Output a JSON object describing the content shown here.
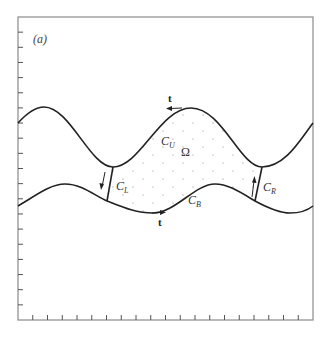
{
  "figure": {
    "panel_label": "(a)",
    "region_label": "Ω",
    "tangent_label": "t",
    "boundaries": {
      "upper": {
        "letter": "C",
        "subscript": "U"
      },
      "bottom": {
        "letter": "C",
        "subscript": "B"
      },
      "left": {
        "letter": "C",
        "subscript": "L"
      },
      "right": {
        "letter": "C",
        "subscript": "R"
      }
    },
    "colors": {
      "curve": "#222222",
      "frame": "#8a8a8a",
      "dots": "#bdbdbd",
      "background": "#ffffff"
    },
    "frame": {
      "left": 18,
      "top": 17,
      "right": 313,
      "bottom": 320
    },
    "left_ticks": 20,
    "bottom_ticks": 20
  }
}
